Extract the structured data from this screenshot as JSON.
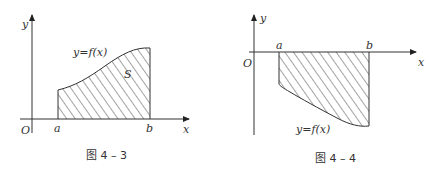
{
  "figures": [
    {
      "id": "fig-4-3",
      "caption": "图 4 – 3",
      "labels": {
        "y_axis": "y",
        "x_axis": "x",
        "origin": "O",
        "a": "a",
        "b": "b",
        "curve": "y=f(x)",
        "area": "S"
      },
      "description": "Region under positive curve y=f(x) between x=a and x=b, shaded with diagonal hatching, labeled S"
    },
    {
      "id": "fig-4-4",
      "caption": "图 4 – 4",
      "labels": {
        "y_axis": "y",
        "x_axis": "x",
        "origin": "O",
        "a": "a",
        "b": "b",
        "curve": "y=f(x)"
      },
      "description": "Region between x-axis and negative curve y=f(x) from x=a to x=b, shaded with diagonal hatching below the axis"
    }
  ],
  "colors": {
    "ink": "#333333",
    "background": "#ffffff"
  }
}
